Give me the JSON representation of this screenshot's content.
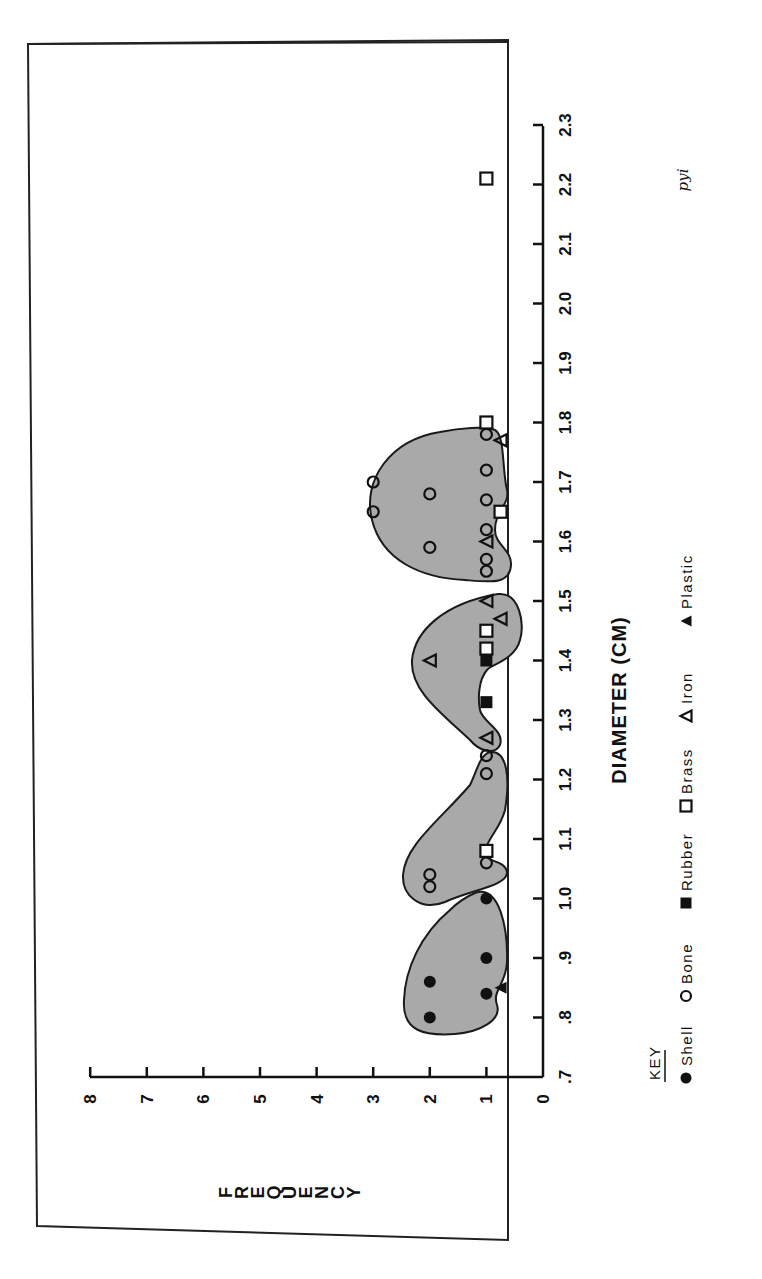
{
  "chart_data": {
    "type": "scatter",
    "orientation": "rotated-90-ccw",
    "title": "",
    "xlabel": "DIAMETER (CM)",
    "ylabel": "FREQUENCY",
    "xlim": [
      0.7,
      2.3
    ],
    "ylim": [
      0,
      8
    ],
    "x_ticks": [
      ".7",
      ".8",
      ".9",
      "1.0",
      "1.1",
      "1.2",
      "1.3",
      "1.4",
      "1.5",
      "1.6",
      "1.7",
      "1.8",
      "1.9",
      "2.0",
      "2.1",
      "2.2",
      "2.3"
    ],
    "y_ticks": [
      "0",
      "1",
      "2",
      "3",
      "4",
      "5",
      "6",
      "7",
      "8"
    ],
    "grid": false,
    "legend": {
      "title": "KEY",
      "position": "bottom (right edge when rotated)",
      "entries": [
        {
          "name": "Shell",
          "marker": "filled-circle"
        },
        {
          "name": "Bone",
          "marker": "open-circle"
        },
        {
          "name": "Rubber",
          "marker": "filled-square"
        },
        {
          "name": "Brass",
          "marker": "open-square"
        },
        {
          "name": "Iron",
          "marker": "open-triangle"
        },
        {
          "name": "Plastic",
          "marker": "filled-triangle"
        }
      ]
    },
    "series": [
      {
        "name": "Shell",
        "marker": "filled-circle",
        "points": [
          [
            0.8,
            2
          ],
          [
            0.84,
            1
          ],
          [
            0.86,
            2
          ],
          [
            0.9,
            1
          ],
          [
            1.0,
            1
          ]
        ]
      },
      {
        "name": "Bone",
        "marker": "open-circle",
        "points": [
          [
            1.02,
            2
          ],
          [
            1.04,
            2
          ],
          [
            1.06,
            1
          ],
          [
            1.21,
            1
          ],
          [
            1.24,
            1
          ],
          [
            1.55,
            1
          ],
          [
            1.57,
            1
          ],
          [
            1.59,
            2
          ],
          [
            1.62,
            1
          ],
          [
            1.65,
            3
          ],
          [
            1.67,
            1
          ],
          [
            1.68,
            2
          ],
          [
            1.7,
            3
          ],
          [
            1.72,
            1
          ],
          [
            1.78,
            1
          ]
        ]
      },
      {
        "name": "Rubber",
        "marker": "filled-square",
        "points": [
          [
            1.33,
            1
          ],
          [
            1.4,
            1
          ]
        ]
      },
      {
        "name": "Brass",
        "marker": "open-square",
        "points": [
          [
            1.08,
            1
          ],
          [
            1.42,
            1
          ],
          [
            1.45,
            1
          ],
          [
            1.65,
            0.75
          ],
          [
            1.8,
            1
          ],
          [
            2.21,
            1
          ]
        ]
      },
      {
        "name": "Iron",
        "marker": "open-triangle",
        "points": [
          [
            1.27,
            1
          ],
          [
            1.4,
            2
          ],
          [
            1.47,
            0.75
          ],
          [
            1.5,
            1
          ],
          [
            1.6,
            1
          ],
          [
            1.77,
            0.75
          ]
        ]
      },
      {
        "name": "Plastic",
        "marker": "filled-triangle",
        "points": [
          [
            0.85,
            0.75
          ]
        ]
      }
    ],
    "annotations": [
      "shaded clusters grouping points at ~0.8–1.0, ~1.0–1.25, ~1.27–1.52, ~1.54–1.80",
      "handwritten note: pyi"
    ]
  },
  "labels": {
    "xlabel": "DIAMETER (CM)",
    "ylabel_letters": [
      "F",
      "R",
      "E",
      "Q",
      "U",
      "E",
      "N",
      "C",
      "Y"
    ],
    "key_title": "KEY",
    "handwritten_note": "pyi"
  }
}
